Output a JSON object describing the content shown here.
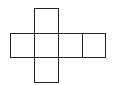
{
  "diagram": {
    "title": "",
    "type": "cube-net",
    "stroke_color": "#222222",
    "cells": [
      {
        "id": "top",
        "x": 34,
        "y": 8,
        "w": 24,
        "h": 25
      },
      {
        "id": "left",
        "x": 10,
        "y": 33,
        "w": 24,
        "h": 24
      },
      {
        "id": "center",
        "x": 34,
        "y": 33,
        "w": 24,
        "h": 24
      },
      {
        "id": "right",
        "x": 58,
        "y": 33,
        "w": 24,
        "h": 24
      },
      {
        "id": "far-right",
        "x": 82,
        "y": 33,
        "w": 23,
        "h": 24
      },
      {
        "id": "bottom",
        "x": 34,
        "y": 57,
        "w": 24,
        "h": 25
      }
    ]
  }
}
